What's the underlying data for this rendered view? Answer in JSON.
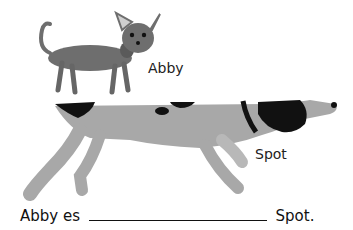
{
  "worksheet": {
    "dogs": [
      {
        "name": "Abby",
        "description": "small chihuahua illustration",
        "color": "#6e6e6e"
      },
      {
        "name": "Spot",
        "description": "large spotted pointer dog illustration",
        "color": "#a8a8a8",
        "spot_color": "#111111"
      }
    ],
    "sentence": {
      "before": "Abby es",
      "blank": "",
      "after": "Spot."
    }
  }
}
